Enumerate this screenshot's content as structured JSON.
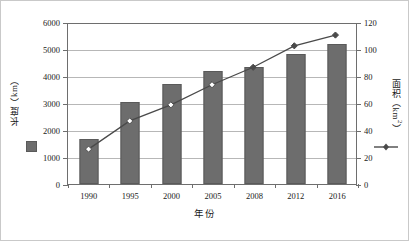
{
  "chart_data": {
    "type": "bar",
    "title": "",
    "subtitle": "",
    "xlabel": "年份",
    "categories": [
      "1990",
      "1995",
      "2000",
      "2005",
      "2008",
      "2012",
      "2016"
    ],
    "grid": true,
    "legend_position": "inline-axis",
    "axes": {
      "left": {
        "label": "长度（km）",
        "unit": "km",
        "min": 0,
        "max": 6000,
        "step": 1000,
        "ticks": [
          "0",
          "1000",
          "2000",
          "3000",
          "4000",
          "5000",
          "6000"
        ]
      },
      "right": {
        "label": "面积（km2）",
        "unit": "km2",
        "min": 0,
        "max": 120,
        "step": 20,
        "ticks": [
          "0",
          "20",
          "40",
          "60",
          "80",
          "100",
          "120"
        ]
      }
    },
    "series": [
      {
        "name": "长度（km）",
        "type": "bar",
        "axis": "left",
        "color": "#6d6d6d",
        "values": [
          1650,
          3020,
          3700,
          4170,
          4350,
          4820,
          5180
        ]
      },
      {
        "name": "面积（km2）",
        "type": "line",
        "axis": "right",
        "color": "#4a4a4a",
        "marker": "diamond",
        "values": [
          26,
          47,
          59,
          74,
          87,
          103,
          111
        ]
      }
    ]
  },
  "labels": {
    "left_axis_title_main": "长度",
    "left_axis_title_unit": "（km）",
    "right_axis_title_main": "面积",
    "right_axis_title_unit_pre": "（km",
    "right_axis_title_unit_sup": "2",
    "right_axis_title_unit_post": "）",
    "x_axis_title": "年份"
  },
  "colors": {
    "bar_fill": "#6d6d6d",
    "bar_stroke": "#5a5a5a",
    "line": "#4a4a4a",
    "gridline": "#b7b7b7",
    "axis": "#6e6e6e",
    "frame": "#c9c9c9",
    "background": "#ffffff"
  }
}
